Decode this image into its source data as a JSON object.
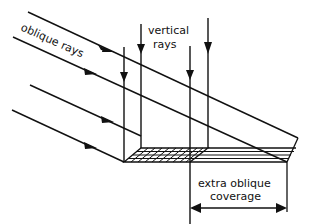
{
  "diagram": {
    "labels": {
      "oblique": "oblique rays",
      "vertical_line1": "vertical",
      "vertical_line2": "rays",
      "coverage_line1": "extra oblique",
      "coverage_line2": "coverage"
    },
    "colors": {
      "ink": "#111111",
      "background": "#ffffff"
    }
  }
}
